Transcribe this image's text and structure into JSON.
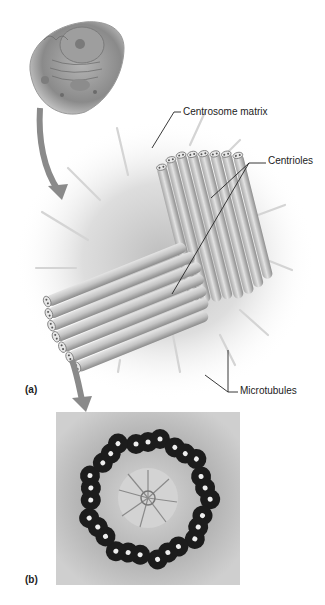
{
  "figure": {
    "panel_a": {
      "label": "(a)",
      "annotations": {
        "centrosome_matrix": "Centrosome matrix",
        "centrioles": "Centrioles",
        "microtubules": "Microtubules"
      }
    },
    "panel_b": {
      "label": "(b)"
    }
  },
  "colors": {
    "arrow": "#8a8a8a",
    "tube_light": "#d8d8d8",
    "tube_dark": "#9a9a9a",
    "matrix_glow": "#bdbdbd",
    "micrograph_bg": "#c9c9c9",
    "micrograph_dark": "#1a1a1a"
  }
}
